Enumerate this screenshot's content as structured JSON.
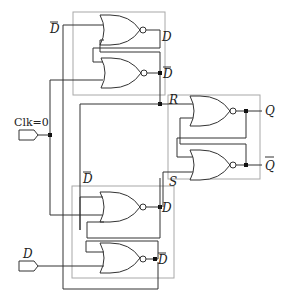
{
  "diagram": {
    "title": "",
    "type": "master-slave D flip-flop built from NOR gates",
    "inputs": [
      {
        "id": "clk",
        "label": "Clk=0"
      },
      {
        "id": "d",
        "label": "D"
      }
    ],
    "outputs": [
      {
        "id": "q",
        "label": "Q"
      },
      {
        "id": "qbar",
        "label": "Q",
        "overline": true
      }
    ],
    "labels": {
      "top_dbar_in": "D",
      "top_d_out": "D",
      "top_dbar_out": "D",
      "r": "R",
      "s": "S",
      "bottom_dbar_in": "D",
      "bottom_d_out": "D",
      "bottom_dbar_out": "D"
    },
    "gates": [
      {
        "id": "top-nor-1",
        "type": "NOR"
      },
      {
        "id": "top-nor-2",
        "type": "NOR"
      },
      {
        "id": "sr-nor-top",
        "type": "NOR"
      },
      {
        "id": "sr-nor-bottom",
        "type": "NOR"
      },
      {
        "id": "bottom-nor-1",
        "type": "NOR"
      },
      {
        "id": "bottom-nor-2",
        "type": "NOR"
      }
    ]
  }
}
